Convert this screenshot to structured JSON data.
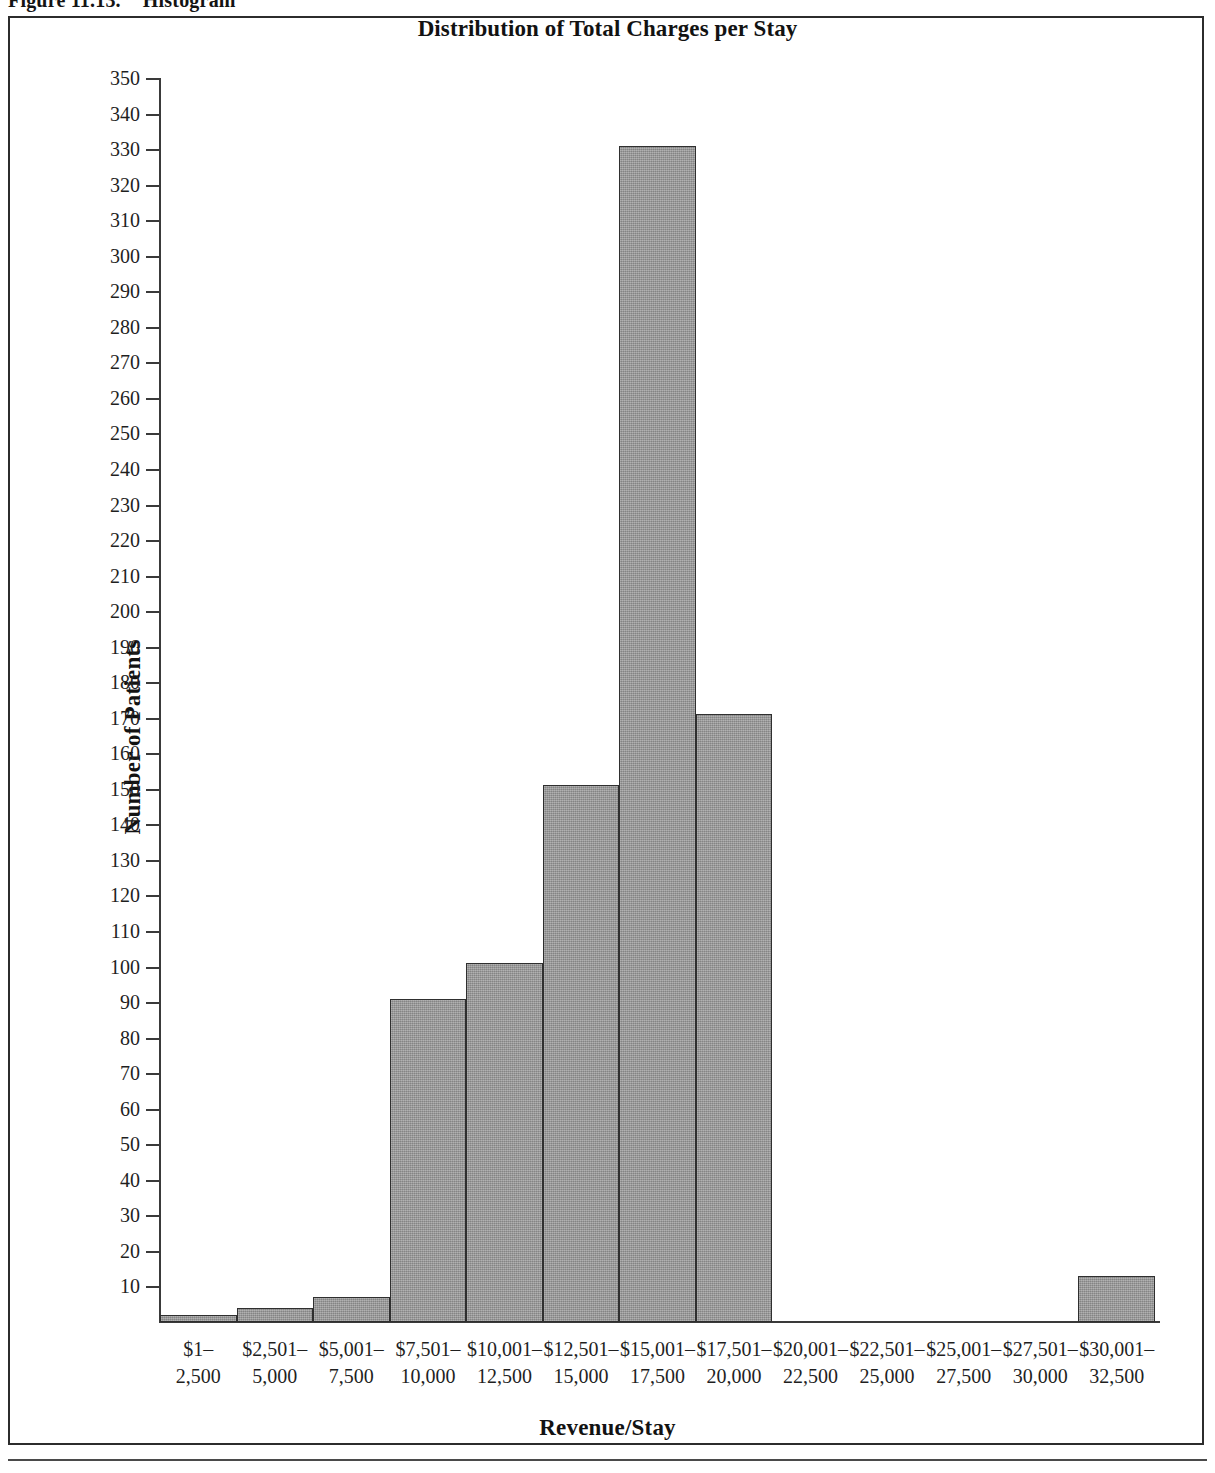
{
  "figure": {
    "caption_number": "Figure 11.13.",
    "caption_text": "Histogram"
  },
  "chart_data": {
    "type": "bar",
    "title": "Distribution of Total Charges per Stay",
    "xlabel": "Revenue/Stay",
    "ylabel": "Number of Patients",
    "grid": false,
    "legend": "none",
    "ylim": [
      0,
      350
    ],
    "ytick_step": 10,
    "ytick_labels": [
      "350",
      "340",
      "330",
      "320",
      "310",
      "300",
      "290",
      "280",
      "270",
      "260",
      "250",
      "240",
      "230",
      "220",
      "210",
      "200",
      "190",
      "180",
      "170",
      "160",
      "150",
      "140",
      "130",
      "120",
      "110",
      "100",
      "90",
      "80",
      "70",
      "60",
      "50",
      "40",
      "30",
      "20",
      "10"
    ],
    "categories": [
      "$1-2,500",
      "$2,501-5,000",
      "$5,001-7,500",
      "$7,501-10,000",
      "$10,001-12,500",
      "$12,501-15,000",
      "$15,001-17,500",
      "$17,501-20,000",
      "$20,001-22,500",
      "$22,501-25,000",
      "$25,001-27,500",
      "$27,501-30,000",
      "$30,001-32,500"
    ],
    "category_lines": [
      {
        "line1": "$1–",
        "line2": "2,500"
      },
      {
        "line1": "$2,501–",
        "line2": "5,000"
      },
      {
        "line1": "$5,001–",
        "line2": "7,500"
      },
      {
        "line1": "$7,501–",
        "line2": "10,000"
      },
      {
        "line1": "$10,001–",
        "line2": "12,500"
      },
      {
        "line1": "$12,501–",
        "line2": "15,000"
      },
      {
        "line1": "$15,001–",
        "line2": "17,500"
      },
      {
        "line1": "$17,501–",
        "line2": "20,000"
      },
      {
        "line1": "$20,001–",
        "line2": "22,500"
      },
      {
        "line1": "$22,501–",
        "line2": "25,000"
      },
      {
        "line1": "$25,001–",
        "line2": "27,500"
      },
      {
        "line1": "$27,501–",
        "line2": "30,000"
      },
      {
        "line1": "$30,001–",
        "line2": "32,500"
      }
    ],
    "values": [
      2,
      4,
      7,
      91,
      101,
      151,
      331,
      171,
      0,
      0,
      0,
      0,
      13
    ]
  },
  "style": {
    "bar_fill": "#949494",
    "bar_border": "#2f2f2f",
    "axis_color": "#3a3a3a",
    "frame_color": "#2c2c2c",
    "text_color": "#1f1f1f",
    "background": "#ffffff"
  }
}
